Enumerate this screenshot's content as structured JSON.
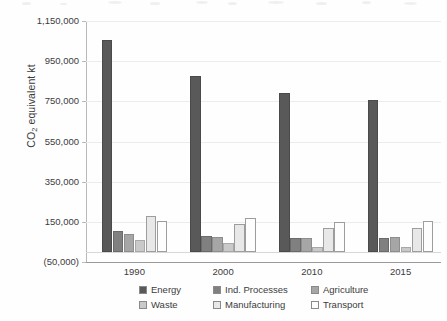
{
  "chart_data": {
    "type": "bar",
    "title": "",
    "subtitle": "",
    "xlabel": "",
    "ylabel": "CO2 equivalent kt",
    "ylabel_parts": {
      "prefix": "CO",
      "sub": "2",
      "suffix": " equivalent kt"
    },
    "categories": [
      "1990",
      "2000",
      "2010",
      "2015"
    ],
    "ylim": [
      -50000,
      1150000
    ],
    "ytick_values": [
      1150000,
      950000,
      750000,
      550000,
      350000,
      150000,
      -50000
    ],
    "ytick_labels": [
      "1,150,000",
      "950,000",
      "750,000",
      "550,000",
      "350,000",
      "150,000",
      "(50,000)"
    ],
    "grid": true,
    "grid_axis": "y",
    "legend_position": "bottom",
    "series": [
      {
        "name": "Energy",
        "color": "#595959",
        "values": [
          1058000,
          875000,
          790000,
          755000
        ]
      },
      {
        "name": "Ind. Processes",
        "color": "#808080",
        "values": [
          105000,
          82000,
          72000,
          70000
        ]
      },
      {
        "name": "Agriculture",
        "color": "#a6a6a6",
        "values": [
          92000,
          77000,
          72000,
          75000
        ]
      },
      {
        "name": "Waste",
        "color": "#c9c9c9",
        "values": [
          60000,
          47000,
          27000,
          25000
        ]
      },
      {
        "name": "Manufacturing",
        "color": "#e8e8e8",
        "values": [
          177000,
          137000,
          120000,
          120000
        ]
      },
      {
        "name": "Transport",
        "color": "#fdfdfd",
        "values": [
          155000,
          170000,
          148000,
          152000
        ]
      }
    ]
  },
  "legend": {
    "items": [
      {
        "label": "Energy",
        "swatch": "#595959"
      },
      {
        "label": "Ind. Processes",
        "swatch": "#808080"
      },
      {
        "label": "Agriculture",
        "swatch": "#a6a6a6"
      },
      {
        "label": "Waste",
        "swatch": "#c9c9c9"
      },
      {
        "label": "Manufacturing",
        "swatch": "#e8e8e8"
      },
      {
        "label": "Transport",
        "swatch": "#fdfdfd"
      }
    ]
  },
  "colors": {
    "gridline": "#ececec",
    "axis": "#9a9a9a",
    "text": "#3c3c3c",
    "background": "#ffffff"
  }
}
